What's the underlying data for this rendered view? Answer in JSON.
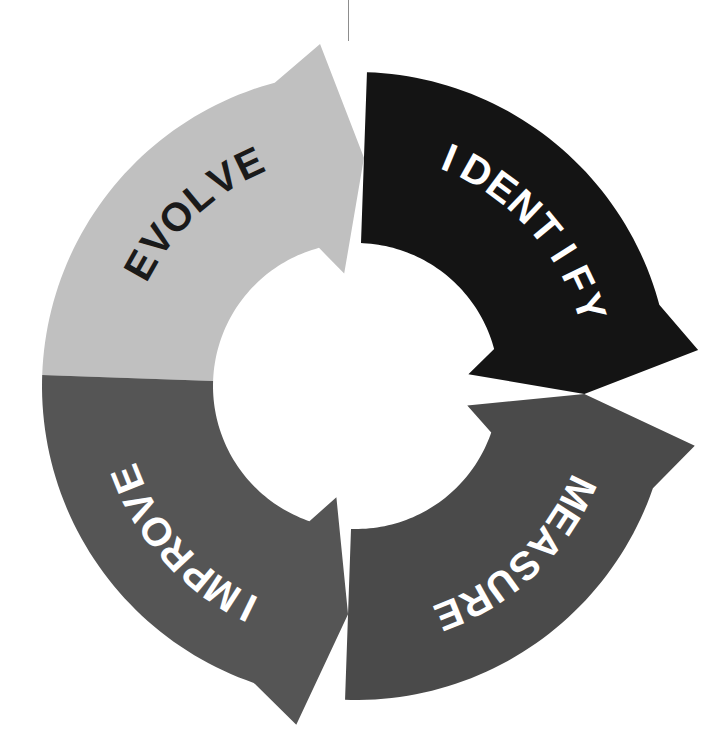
{
  "diagram": {
    "type": "cycle",
    "shape": "donut-arrow-ring",
    "background_color": "#ffffff",
    "center": {
      "x": 356,
      "y": 386
    },
    "outer_radius": 314,
    "inner_radius": 143,
    "direction": "bidirectional",
    "segment_count": 4,
    "segments": [
      {
        "label": "EVOLVE",
        "position": "top",
        "fill_color": "#c0c0c0",
        "text_color": "#1a1a1a",
        "start_angle_deg": 182,
        "end_angle_deg": 272,
        "arrow_direction": "clockwise",
        "text_radius": 247,
        "text_size": 40,
        "text_mid_angle_deg": 227
      },
      {
        "label": "IDENTIFY",
        "position": "right",
        "fill_color": "#141414",
        "text_color": "#ffffff",
        "start_angle_deg": 272,
        "end_angle_deg": 362,
        "arrow_direction": "clockwise",
        "text_radius": 247,
        "text_size": 40,
        "text_mid_angle_deg": 317
      },
      {
        "label": "MEASURE",
        "position": "bottom",
        "fill_color": "#4a4a4a",
        "text_color": "#ffffff",
        "start_angle_deg": 2,
        "end_angle_deg": 92,
        "arrow_direction": "counter-clockwise",
        "text_radius": 247,
        "text_size": 40,
        "text_mid_angle_deg": 47
      },
      {
        "label": "IMPROVE",
        "position": "left",
        "fill_color": "#555555",
        "text_color": "#ffffff",
        "start_angle_deg": 92,
        "end_angle_deg": 182,
        "arrow_direction": "counter-clockwise",
        "text_radius": 247,
        "text_size": 40,
        "text_mid_angle_deg": 137
      }
    ],
    "hairline": {
      "present": true,
      "color": "#8d8d8d",
      "x": 348,
      "top": 0,
      "height": 41
    }
  }
}
